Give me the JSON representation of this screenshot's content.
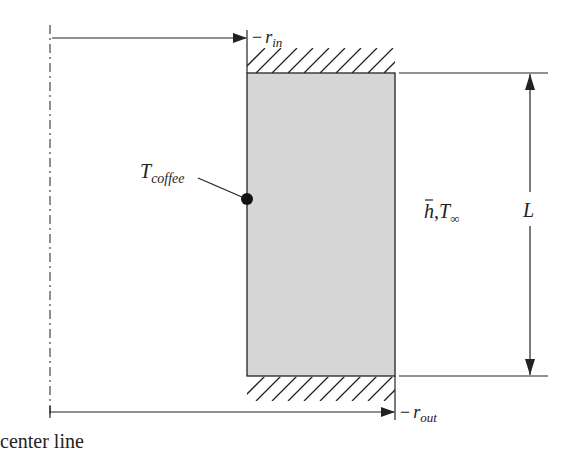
{
  "diagram": {
    "labels": {
      "r_in_prefix": "−",
      "r_in_main": "r",
      "r_in_sub": "in",
      "r_out_prefix": "−",
      "r_out_main": "r",
      "r_out_sub": "out",
      "t_coffee_main": "T",
      "t_coffee_sub": "coffee",
      "h_bar": "h",
      "comma": ",",
      "t_inf_main": "T",
      "t_inf_sub": "∞",
      "length": "L",
      "center_line": "center line"
    },
    "colors": {
      "wall_fill": "#d6d6d6",
      "stroke": "#222222",
      "background": "#ffffff"
    }
  }
}
